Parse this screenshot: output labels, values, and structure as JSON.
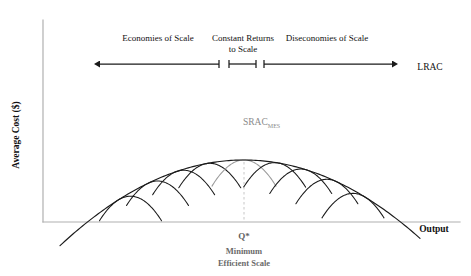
{
  "axes": {
    "y_label": "Average Cost ($)",
    "x_label": "Output",
    "color": "#b0b0b0",
    "origin_x": 43,
    "origin_y": 222,
    "x_end": 460,
    "y_top": 20
  },
  "annotations": {
    "lrac_label": "LRAC",
    "srac_label": "SRAC",
    "srac_subscript": "MES",
    "q_star_label": "Q*",
    "mes_line1": "Minimum",
    "mes_line2": "Efficient Scale"
  },
  "regions": [
    {
      "label": "Economies of Scale",
      "x": 158,
      "y": 41,
      "start": 100,
      "end": 219
    },
    {
      "label": "Constant Returns",
      "x": 243,
      "y": 41,
      "start": 229,
      "end": 256
    },
    {
      "label": "to Scale",
      "x": 243,
      "y": 51,
      "start": 229,
      "end": 256
    },
    {
      "label": "Diseconomies of Scale",
      "x": 327,
      "y": 41,
      "start": 264,
      "end": 392
    }
  ],
  "arrow_axis": {
    "y": 64,
    "left_tip": 100,
    "right_tip": 392,
    "tick_positions": [
      219,
      229,
      256,
      264
    ],
    "tick_half_height": 4,
    "color": "#1a1a1a"
  },
  "chart_data": {
    "type": "line",
    "xlabel": "Output",
    "ylabel": "Average Cost ($)",
    "grid": false,
    "legend": false,
    "curve_color_dark": "#1a1a1a",
    "curve_color_gray": "#9a9a9a",
    "dashed_color": "#cccccc",
    "lrac": {
      "name": "LRAC",
      "vertex_x": 244,
      "vertex_y": 160,
      "curvature": 0.00253,
      "x_start": 60,
      "x_end": 420,
      "comment": "Long-run average cost envelope: U-shaped parabola tangent to every SRAC"
    },
    "srac_curves": [
      {
        "name": "SRAC1",
        "tangent_x": 118,
        "vertex_x": 132,
        "vertex_y": 148,
        "curvature": 0.0255,
        "half_width": 31,
        "color": "dark"
      },
      {
        "name": "SRAC2",
        "tangent_x": 148,
        "vertex_x": 160,
        "vertex_y": 152,
        "curvature": 0.0255,
        "half_width": 31,
        "color": "dark"
      },
      {
        "name": "SRAC3",
        "tangent_x": 177,
        "vertex_x": 187,
        "vertex_y": 156,
        "curvature": 0.0255,
        "half_width": 31,
        "color": "dark"
      },
      {
        "name": "SRAC4",
        "tangent_x": 206,
        "vertex_x": 213,
        "vertex_y": 158,
        "curvature": 0.0255,
        "half_width": 31,
        "color": "dark"
      },
      {
        "name": "SRAC_MES",
        "tangent_x": 244,
        "vertex_x": 244,
        "vertex_y": 160,
        "curvature": 0.0255,
        "half_width": 32,
        "color": "gray"
      },
      {
        "name": "SRAC6",
        "tangent_x": 278,
        "vertex_x": 272,
        "vertex_y": 158,
        "curvature": 0.0255,
        "half_width": 31,
        "color": "dark"
      },
      {
        "name": "SRAC7",
        "tangent_x": 307,
        "vertex_x": 298,
        "vertex_y": 156,
        "curvature": 0.0255,
        "half_width": 31,
        "color": "dark"
      },
      {
        "name": "SRAC8",
        "tangent_x": 336,
        "vertex_x": 325,
        "vertex_y": 152,
        "curvature": 0.0255,
        "half_width": 31,
        "color": "dark"
      },
      {
        "name": "SRAC9",
        "tangent_x": 365,
        "vertex_x": 352,
        "vertex_y": 148,
        "curvature": 0.0255,
        "half_width": 31,
        "color": "dark"
      }
    ],
    "mes_marker": {
      "x": 244,
      "y_top": 162,
      "y_bottom": 222,
      "label": "Q*"
    }
  }
}
